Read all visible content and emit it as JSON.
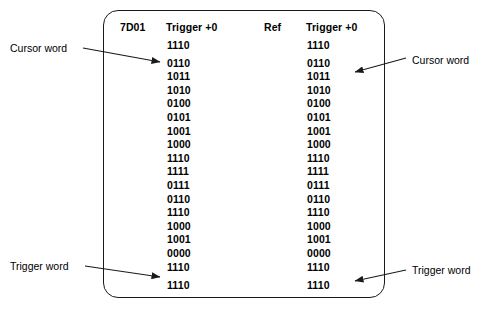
{
  "panel": {
    "headers": {
      "address": "7D01",
      "trigger_left": "Trigger +0",
      "ref": "Ref",
      "trigger_right": "Trigger +0"
    },
    "left_column": [
      "1110",
      "0110",
      "1011",
      "1010",
      "0100",
      "0101",
      "1001",
      "1000",
      "1110",
      "1111",
      "0111",
      "0110",
      "1110",
      "1000",
      "1001",
      "0000",
      "1110",
      "1110"
    ],
    "right_column": [
      "1110",
      "0110",
      "1011",
      "1010",
      "0100",
      "0101",
      "1001",
      "1000",
      "1110",
      "1111",
      "0111",
      "0110",
      "1110",
      "1000",
      "1001",
      "0000",
      "1110",
      "1110"
    ]
  },
  "annotations": {
    "cursor_word_left": "Cursor word",
    "cursor_word_right": "Cursor word",
    "trigger_word_left": "Trigger word",
    "trigger_word_right": "Trigger word"
  },
  "colors": {
    "ink": "#000000",
    "border": "#1a1a1a",
    "background": "#ffffff"
  }
}
